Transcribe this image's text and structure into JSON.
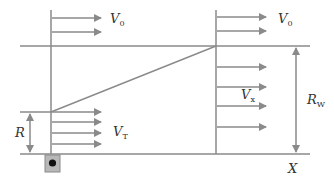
{
  "diagram": {
    "type": "wind-profile-diagram",
    "line_color": "#8a8a8a",
    "labels": {
      "v0_left": {
        "main": "V",
        "sub": "0"
      },
      "v0_right": {
        "main": "V",
        "sub": "0"
      },
      "vx": {
        "main": "V",
        "sub": "x"
      },
      "vt": {
        "main": "V",
        "sub": "T"
      },
      "r": {
        "main": "R",
        "sub": ""
      },
      "rw": {
        "main": "R",
        "sub": "W"
      },
      "x": {
        "main": "X",
        "sub": ""
      }
    },
    "sensor_box": {
      "fill": "#b8b8b8",
      "dot": "#111111"
    }
  }
}
